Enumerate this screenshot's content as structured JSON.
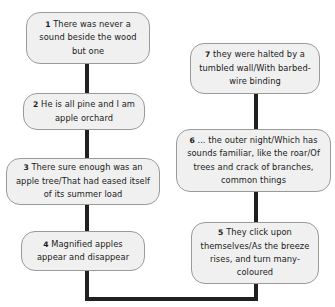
{
  "diagram": {
    "type": "flowchart",
    "orientation": "serpentine-two-column",
    "colors": {
      "node_fill": "#f0f0f0",
      "node_border": "#9a9a9a",
      "connector": "#221f1f",
      "text": "#1a1a1a",
      "background": "#ffffff"
    },
    "nodes": [
      {
        "id": "node-1",
        "number": "1",
        "text": "There was never a sound beside the wood but one",
        "lines": [
          "There was never",
          "a sound beside",
          "the wood but one"
        ],
        "column": "left",
        "order": 1
      },
      {
        "id": "node-2",
        "number": "2",
        "text": "He is all pine and I am apple orchard",
        "lines": [
          "He is all pine and I",
          "am apple orchard"
        ],
        "column": "left",
        "order": 2
      },
      {
        "id": "node-3",
        "number": "3",
        "text": "There sure enough was an apple tree/That had eased itself of its summer load",
        "lines": [
          "There sure enough was an",
          "apple tree/That had eased",
          "itself of its summer load"
        ],
        "column": "left",
        "order": 3
      },
      {
        "id": "node-4",
        "number": "4",
        "text": "Magnified apples appear and disappear",
        "lines": [
          "Magnified apples",
          "appear and disappear"
        ],
        "column": "left",
        "order": 4
      },
      {
        "id": "node-5",
        "number": "5",
        "text": "They click upon themselves/As the breeze rises, and turn many-coloured",
        "lines": [
          "They click upon",
          "themselves/As the",
          "breeze rises, and turn",
          "many-coloured"
        ],
        "column": "right",
        "order": 5
      },
      {
        "id": "node-6",
        "number": "6",
        "text": "... the outer night/Which has sounds familiar, like the roar/Of trees and crack of branches, common things",
        "lines": [
          "... the outer night/Which has",
          "sounds familiar, like the",
          "roar/Of trees and crack of",
          "branches, common things"
        ],
        "column": "right",
        "order": 6
      },
      {
        "id": "node-7",
        "number": "7",
        "text": "they were halted by a tumbled wall/With barbed-wire binding",
        "lines": [
          "they were halted by a",
          "tumbled wall/With",
          "barbed-wire binding"
        ],
        "column": "right",
        "order": 7
      }
    ],
    "edges": [
      {
        "id": "edge-1-2",
        "from": "node-1",
        "to": "node-2",
        "shape": "vertical"
      },
      {
        "id": "edge-2-3",
        "from": "node-2",
        "to": "node-3",
        "shape": "vertical"
      },
      {
        "id": "edge-3-4",
        "from": "node-3",
        "to": "node-4",
        "shape": "vertical"
      },
      {
        "id": "edge-4-5",
        "from": "node-4",
        "to": "node-5",
        "shape": "u-turn-bottom"
      },
      {
        "id": "edge-5-6",
        "from": "node-5",
        "to": "node-6",
        "shape": "vertical"
      },
      {
        "id": "edge-6-7",
        "from": "node-6",
        "to": "node-7",
        "shape": "vertical"
      }
    ]
  }
}
